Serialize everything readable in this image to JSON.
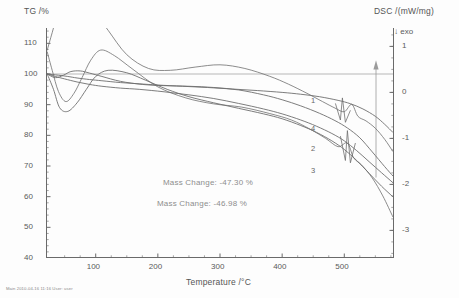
{
  "titles": {
    "left_axis": "TG /%",
    "right_axis": "DSC /(mW/mg)",
    "x_axis": "Temperature /°C",
    "exo_marker": "↓ exo"
  },
  "annotations": {
    "mass_change_1": "Mass Change: -47.30 %",
    "mass_change_2": "Mass Change: -46.98 %"
  },
  "curve_labels": [
    "1",
    "4",
    "2",
    "3"
  ],
  "footer": "Main 2010-04-16 11:16 User: user",
  "colors": {
    "curve": "#6e6e6e",
    "axis": "#6a6a6a",
    "text": "#5b5b5b",
    "annotation": "#8d8d8d",
    "baseline": "#9a9a9a"
  },
  "chart_data": {
    "type": "line",
    "title": "",
    "xlabel": "Temperature /°C",
    "ylabel": "TG /%",
    "y2label": "DSC /(mW/mg)",
    "xlim": [
      20,
      580
    ],
    "ylim": [
      40,
      115
    ],
    "y2lim": [
      -3.6,
      1.4
    ],
    "xticks": [
      100,
      200,
      300,
      400,
      500
    ],
    "yticks": [
      40,
      50,
      60,
      70,
      80,
      90,
      100,
      110
    ],
    "y2ticks": [
      1,
      0,
      -1,
      -2,
      -3
    ],
    "grid": false,
    "legend": "inline-curve-numbers",
    "baseline_tg": 100,
    "series": [
      {
        "name": "1",
        "axis": "left",
        "label_position": {
          "x": 430,
          "y": 92
        },
        "x": [
          22,
          40,
          55,
          70,
          90,
          110,
          140,
          170,
          200,
          240,
          280,
          320,
          360,
          400,
          430,
          460,
          490,
          510,
          530,
          550,
          565,
          578
        ],
        "y": [
          100.0,
          99.6,
          99.2,
          98.7,
          98.2,
          97.8,
          97.2,
          96.8,
          96.4,
          96.0,
          95.6,
          95.1,
          94.6,
          94.0,
          93.4,
          92.6,
          91.4,
          90.3,
          88.6,
          86.2,
          83.6,
          81.0
        ]
      },
      {
        "name": "4",
        "axis": "left",
        "label_position": {
          "x": 430,
          "y": 85
        },
        "x": [
          22,
          35,
          48,
          60,
          75,
          90,
          110,
          140,
          175,
          210,
          250,
          290,
          330,
          370,
          400,
          430,
          460,
          485,
          505,
          525,
          545,
          565,
          578
        ],
        "y": [
          100.0,
          98.8,
          99.6,
          100.8,
          101.0,
          100.3,
          99.2,
          97.6,
          96.6,
          96.2,
          96.0,
          95.6,
          94.8,
          93.2,
          91.6,
          89.6,
          87.2,
          84.8,
          82.4,
          79.2,
          74.6,
          69.8,
          66.8
        ]
      },
      {
        "name": "2",
        "axis": "left",
        "label_position": {
          "x": 430,
          "y": 77
        },
        "x": [
          22,
          35,
          50,
          70,
          90,
          110,
          140,
          170,
          210,
          250,
          290,
          330,
          370,
          400,
          430,
          455,
          480,
          500,
          520,
          540,
          560,
          578
        ],
        "y": [
          100.0,
          99.2,
          98.4,
          97.4,
          96.6,
          96.0,
          95.4,
          95.0,
          94.2,
          93.2,
          92.0,
          90.4,
          88.6,
          87.0,
          85.0,
          83.0,
          80.6,
          78.2,
          75.0,
          71.4,
          67.8,
          64.6
        ]
      },
      {
        "name": "3",
        "axis": "left",
        "label_position": {
          "x": 430,
          "y": 68
        },
        "x": [
          22,
          32,
          42,
          55,
          70,
          85,
          100,
          120,
          150,
          180,
          215,
          250,
          290,
          330,
          370,
          400,
          430,
          455,
          480,
          500,
          520,
          540,
          560,
          578
        ],
        "y": [
          100.0,
          95.0,
          89.0,
          87.8,
          90.6,
          95.0,
          99.2,
          101.2,
          100.4,
          98.0,
          95.0,
          92.6,
          90.6,
          88.8,
          87.0,
          85.4,
          83.2,
          81.0,
          78.2,
          75.4,
          71.8,
          67.6,
          63.4,
          60.0
        ]
      },
      {
        "name": "dsc-upper",
        "axis": "right",
        "x": [
          22,
          30,
          40,
          55,
          70,
          85,
          100,
          120,
          150,
          185,
          220,
          260,
          300,
          340,
          380,
          410,
          440,
          465,
          485,
          500,
          512,
          522,
          535,
          550,
          565,
          578
        ],
        "y": [
          0.92,
          1.3,
          1.75,
          2.05,
          2.15,
          2.02,
          1.72,
          1.35,
          0.82,
          0.52,
          0.48,
          0.55,
          0.6,
          0.52,
          0.35,
          0.18,
          -0.02,
          -0.2,
          -0.34,
          -0.42,
          -0.26,
          -0.52,
          -0.62,
          -0.78,
          -1.02,
          -1.28
        ]
      },
      {
        "name": "dsc-lower",
        "axis": "right",
        "x": [
          22,
          30,
          40,
          52,
          65,
          78,
          92,
          108,
          130,
          160,
          200,
          245,
          290,
          335,
          380,
          415,
          445,
          470,
          490,
          505,
          515,
          528,
          545,
          562,
          578
        ],
        "y": [
          0.88,
          0.48,
          0.02,
          -0.2,
          -0.02,
          0.32,
          0.7,
          0.92,
          0.8,
          0.5,
          0.12,
          -0.12,
          -0.25,
          -0.32,
          -0.46,
          -0.6,
          -0.8,
          -1.0,
          -1.18,
          -1.1,
          -1.42,
          -1.58,
          -1.86,
          -2.25,
          -2.7
        ]
      }
    ],
    "dsc_peaks_note": "sharp endothermic spikes near 490-510 °C on lower DSC traces"
  }
}
